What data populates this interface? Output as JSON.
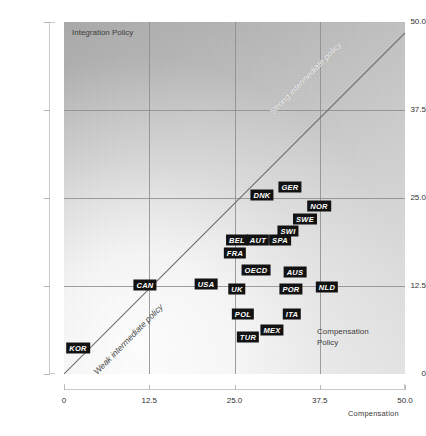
{
  "chart_data": {
    "type": "scatter",
    "title": "",
    "xlabel": "Compensation",
    "ylabel": "Integration",
    "xlim": [
      0,
      50
    ],
    "ylim": [
      0,
      50
    ],
    "xticks": [
      "0",
      "12.5",
      "25.0",
      "37.5",
      "50.0"
    ],
    "xtick_values": [
      0,
      12.5,
      25,
      37.5,
      50
    ],
    "yticks": [
      "0",
      "12.5",
      "25.0",
      "37.5",
      "50.0"
    ],
    "ytick_values": [
      0,
      12.5,
      25,
      37.5,
      50
    ],
    "grid": true,
    "legend": "none",
    "reference_line": {
      "type": "identity",
      "from": [
        0,
        0
      ],
      "to": [
        50,
        50
      ]
    },
    "annotations": [
      {
        "name": "integration-policy-corner",
        "text": "Integration Policy",
        "corner": "top-left"
      },
      {
        "name": "compensation-policy-corner",
        "text": "Compensation\nPolicy",
        "corner": "bottom-right"
      },
      {
        "name": "strong-intermediate-policy",
        "text": "Strong intermediate policy",
        "along": "diagonal-upper"
      },
      {
        "name": "weak-intermediate-policy",
        "text": "Weak intermediate policy",
        "along": "diagonal-lower"
      }
    ],
    "points": [
      {
        "label": "KOR",
        "x": 2.1,
        "y": 3.6,
        "px": 78,
        "py": 348
      },
      {
        "label": "CAN",
        "x": 11.9,
        "y": 12.6,
        "px": 145,
        "py": 285
      },
      {
        "label": "USA",
        "x": 20.9,
        "y": 12.7,
        "px": 206,
        "py": 284
      },
      {
        "label": "UK",
        "x": 25.4,
        "y": 12.0,
        "px": 237,
        "py": 289
      },
      {
        "label": "POL",
        "x": 26.3,
        "y": 8.4,
        "px": 243,
        "py": 314
      },
      {
        "label": "TUR",
        "x": 27.0,
        "y": 5.1,
        "px": 248,
        "py": 337
      },
      {
        "label": "MEX",
        "x": 30.5,
        "y": 6.1,
        "px": 272,
        "py": 330
      },
      {
        "label": "ITA",
        "x": 33.5,
        "y": 8.4,
        "px": 292,
        "py": 314
      },
      {
        "label": "OECD",
        "x": 28.2,
        "y": 14.7,
        "px": 256,
        "py": 270
      },
      {
        "label": "AUS",
        "x": 33.9,
        "y": 14.4,
        "px": 295,
        "py": 272
      },
      {
        "label": "POR",
        "x": 33.3,
        "y": 11.8,
        "px": 291,
        "py": 289
      },
      {
        "label": "NLD",
        "x": 38.6,
        "y": 12.1,
        "px": 327,
        "py": 287
      },
      {
        "label": "FRA",
        "x": 25.1,
        "y": 17.1,
        "px": 235,
        "py": 253
      },
      {
        "label": "BEL",
        "x": 25.4,
        "y": 18.9,
        "px": 237,
        "py": 240
      },
      {
        "label": "AUT",
        "x": 28.5,
        "y": 18.9,
        "px": 258,
        "py": 240
      },
      {
        "label": "SPA",
        "x": 31.7,
        "y": 18.9,
        "px": 280,
        "py": 240
      },
      {
        "label": "SWI",
        "x": 32.9,
        "y": 20.3,
        "px": 288,
        "py": 231
      },
      {
        "label": "SWE",
        "x": 35.4,
        "y": 22.0,
        "px": 305,
        "py": 219
      },
      {
        "label": "NOR",
        "x": 37.4,
        "y": 23.9,
        "px": 319,
        "py": 206
      },
      {
        "label": "DNK",
        "x": 29.1,
        "y": 25.4,
        "px": 262,
        "py": 195
      },
      {
        "label": "GER",
        "x": 33.2,
        "y": 26.5,
        "px": 290,
        "py": 187
      }
    ]
  },
  "axes": {
    "y_title": "Integration",
    "x_title": "Compensation"
  },
  "notes": {
    "integration_policy": "Integration Policy",
    "compensation_policy": "Compensation\nPolicy",
    "strong_intermediate": "Strong intermediate policy",
    "weak_intermediate": "Weak intermediate policy"
  }
}
